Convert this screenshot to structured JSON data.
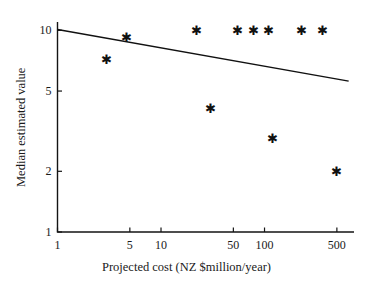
{
  "chart_data": {
    "type": "scatter",
    "title": "",
    "xlabel": "Projected cost (NZ $million/year)",
    "ylabel": "Median estimated value",
    "xscale": "log",
    "yscale": "log",
    "xlim": [
      1,
      700
    ],
    "ylim": [
      1,
      11
    ],
    "grid": false,
    "legend": null,
    "xticks": [
      1,
      5,
      10,
      50,
      100,
      500
    ],
    "xtick_labels": [
      "1",
      "5",
      "10",
      "50",
      "100",
      "500"
    ],
    "yticks": [
      1,
      2,
      5,
      10
    ],
    "ytick_labels": [
      "1",
      "2",
      "5",
      "10"
    ],
    "marker": "asterisk",
    "marker_color": "#111111",
    "points": [
      {
        "x": 3,
        "y": 7.2
      },
      {
        "x": 4.6,
        "y": 9.2
      },
      {
        "x": 22,
        "y": 10
      },
      {
        "x": 30,
        "y": 4.1
      },
      {
        "x": 55,
        "y": 10
      },
      {
        "x": 78,
        "y": 10
      },
      {
        "x": 110,
        "y": 10
      },
      {
        "x": 120,
        "y": 2.9
      },
      {
        "x": 230,
        "y": 10
      },
      {
        "x": 360,
        "y": 10
      },
      {
        "x": 500,
        "y": 2.0
      }
    ],
    "trendline": {
      "type": "line",
      "color": "#111111",
      "x_start": 1,
      "y_start": 10.1,
      "x_end": 650,
      "y_end": 5.6
    }
  }
}
